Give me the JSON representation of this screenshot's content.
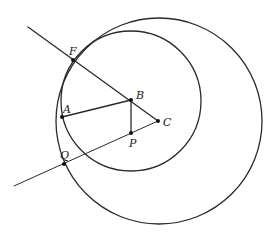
{
  "diagram": {
    "colors": {
      "stroke": "#2a2a2a",
      "background": "#ffffff"
    },
    "circles": [
      {
        "name": "outer",
        "cx": 159,
        "cy": 121,
        "r": 103
      },
      {
        "name": "inner",
        "cx": 131,
        "cy": 101,
        "r": 70
      }
    ],
    "points": {
      "F": {
        "x": 73,
        "y": 60,
        "label": "F",
        "lx": 69,
        "ly": 55
      },
      "A": {
        "x": 62,
        "y": 117,
        "label": "A",
        "lx": 63,
        "ly": 113
      },
      "B": {
        "x": 131,
        "y": 100,
        "label": "B",
        "lx": 136,
        "ly": 99
      },
      "C": {
        "x": 158,
        "y": 121,
        "label": "C",
        "lx": 163,
        "ly": 126
      },
      "P": {
        "x": 131,
        "y": 133,
        "label": "P",
        "lx": 129,
        "ly": 147
      },
      "Q": {
        "x": 64,
        "y": 164,
        "label": "Q",
        "lx": 60,
        "ly": 159
      }
    },
    "segments": [
      {
        "name": "ray-through-F-to-C",
        "x1": 28,
        "y1": 27,
        "x2": 158,
        "y2": 121,
        "width": 1.3
      },
      {
        "name": "ray-through-Q-to-C",
        "x1": 14,
        "y1": 186,
        "x2": 158,
        "y2": 121,
        "width": 1.0
      },
      {
        "name": "segment-AB",
        "x1": 62,
        "y1": 117,
        "x2": 131,
        "y2": 100,
        "width": 1.3
      },
      {
        "name": "segment-BP",
        "x1": 131,
        "y1": 100,
        "x2": 131,
        "y2": 133,
        "width": 1.3
      }
    ]
  }
}
